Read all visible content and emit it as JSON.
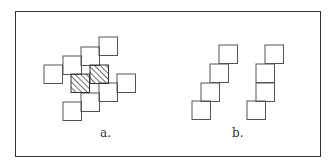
{
  "figure": {
    "frame": {
      "x": 15,
      "y": 11,
      "width": 306,
      "height": 146
    },
    "stroke_color": "#555555",
    "hatch_color": "#333333",
    "square_size": 18.5,
    "panels": [
      {
        "label": "a.",
        "label_pos": {
          "x": 100,
          "y": 126
        },
        "squares": [
          {
            "x": 99,
            "y": 37,
            "hatched": false
          },
          {
            "x": 81,
            "y": 47,
            "hatched": false
          },
          {
            "x": 63,
            "y": 56,
            "hatched": false
          },
          {
            "x": 44,
            "y": 65,
            "hatched": false
          },
          {
            "x": 117,
            "y": 74,
            "hatched": false
          },
          {
            "x": 99,
            "y": 83,
            "hatched": false
          },
          {
            "x": 81,
            "y": 93,
            "hatched": false
          },
          {
            "x": 63,
            "y": 102,
            "hatched": false
          },
          {
            "x": 90,
            "y": 65,
            "hatched": true
          },
          {
            "x": 71,
            "y": 74,
            "hatched": true
          }
        ]
      },
      {
        "label": "b.",
        "label_pos": {
          "x": 232,
          "y": 126
        },
        "squares": [
          {
            "x": 219,
            "y": 45,
            "hatched": false
          },
          {
            "x": 210,
            "y": 64,
            "hatched": false
          },
          {
            "x": 201,
            "y": 83,
            "hatched": false
          },
          {
            "x": 192,
            "y": 101,
            "hatched": false
          },
          {
            "x": 265,
            "y": 45,
            "hatched": false
          },
          {
            "x": 256,
            "y": 64,
            "hatched": false
          },
          {
            "x": 256,
            "y": 83,
            "hatched": false
          },
          {
            "x": 247,
            "y": 101,
            "hatched": false
          }
        ]
      }
    ]
  }
}
